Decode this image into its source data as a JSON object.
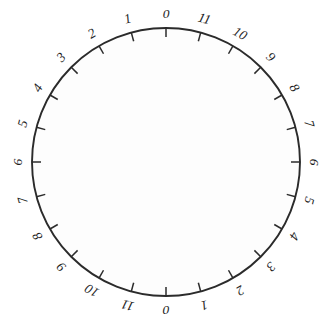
{
  "figure": {
    "type": "circular-dial",
    "title": "",
    "background_color": "#ffffff",
    "interior_color": "#fdfdfd",
    "stroke_color": "#2b2b2b",
    "label_color": "#1d1d1d",
    "center": {
      "x": 166,
      "y": 162
    },
    "radius": 134,
    "tick_count": 24,
    "tick_step_degrees": 15,
    "tick_length": 9,
    "label_offset": 13,
    "label_font_size": 13.5,
    "label_style": "italic",
    "labels_outside": true,
    "ticks_point_inward": true
  },
  "chart_data": {
    "type": "scatter",
    "title": "",
    "xlabel": "",
    "ylabel": "",
    "grid": false,
    "legend": null,
    "coordinate_system": "polar",
    "angle_units": "degrees",
    "angle_zero_at": "top",
    "tick_angles": [
      0,
      15,
      30,
      45,
      60,
      75,
      90,
      105,
      120,
      135,
      150,
      165,
      180,
      195,
      210,
      225,
      240,
      255,
      270,
      285,
      300,
      315,
      330,
      345
    ],
    "tick_labels": [
      "0",
      "11",
      "10",
      "9",
      "8",
      "7",
      "6",
      "5",
      "4",
      "3",
      "2",
      "1",
      "0",
      "11",
      "10",
      "9",
      "8",
      "7",
      "6",
      "5",
      "4",
      "3",
      "2",
      "1"
    ],
    "marks": [
      {
        "index": 0,
        "angle": 0,
        "label": "0",
        "quadrant": "top"
      },
      {
        "index": 1,
        "angle": 15,
        "label": "11",
        "quadrant": "top-right"
      },
      {
        "index": 2,
        "angle": 30,
        "label": "10",
        "quadrant": "top-right"
      },
      {
        "index": 3,
        "angle": 45,
        "label": "9",
        "quadrant": "top-right"
      },
      {
        "index": 4,
        "angle": 60,
        "label": "8",
        "quadrant": "top-right"
      },
      {
        "index": 5,
        "angle": 75,
        "label": "7",
        "quadrant": "right"
      },
      {
        "index": 6,
        "angle": 90,
        "label": "6",
        "quadrant": "right"
      },
      {
        "index": 7,
        "angle": 105,
        "label": "5",
        "quadrant": "right"
      },
      {
        "index": 8,
        "angle": 120,
        "label": "4",
        "quadrant": "bottom-right"
      },
      {
        "index": 9,
        "angle": 135,
        "label": "3",
        "quadrant": "bottom-right"
      },
      {
        "index": 10,
        "angle": 150,
        "label": "2",
        "quadrant": "bottom-right"
      },
      {
        "index": 11,
        "angle": 165,
        "label": "1",
        "quadrant": "bottom"
      },
      {
        "index": 12,
        "angle": 180,
        "label": "0",
        "quadrant": "bottom"
      },
      {
        "index": 13,
        "angle": 195,
        "label": "11",
        "quadrant": "bottom-left"
      },
      {
        "index": 14,
        "angle": 210,
        "label": "10",
        "quadrant": "bottom-left"
      },
      {
        "index": 15,
        "angle": 225,
        "label": "9",
        "quadrant": "bottom-left"
      },
      {
        "index": 16,
        "angle": 240,
        "label": "8",
        "quadrant": "left"
      },
      {
        "index": 17,
        "angle": 255,
        "label": "7",
        "quadrant": "left"
      },
      {
        "index": 18,
        "angle": 270,
        "label": "6",
        "quadrant": "left"
      },
      {
        "index": 19,
        "angle": 285,
        "label": "5",
        "quadrant": "left"
      },
      {
        "index": 20,
        "angle": 300,
        "label": "4",
        "quadrant": "top-left"
      },
      {
        "index": 21,
        "angle": 315,
        "label": "3",
        "quadrant": "top-left"
      },
      {
        "index": 22,
        "angle": 330,
        "label": "2",
        "quadrant": "top-left"
      },
      {
        "index": 23,
        "angle": 345,
        "label": "1",
        "quadrant": "top"
      }
    ]
  }
}
